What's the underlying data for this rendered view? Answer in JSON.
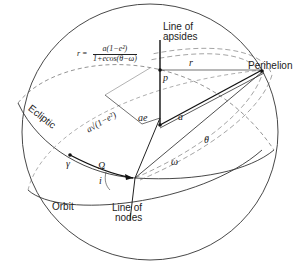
{
  "figure": {
    "labels": {
      "line_of_apsides": "Line of\napsides",
      "line_of_apsides_1": "Line of",
      "line_of_apsides_2": "apsides",
      "perihelion": "Perihelion",
      "ecliptic": "Ecliptic",
      "orbit": "Orbit",
      "line_of_nodes_1": "Line of",
      "line_of_nodes_2": "nodes"
    },
    "formula": {
      "lhs": "r =",
      "numerator": "a(1−e²)",
      "denominator": "1+ecos(θ−ω)"
    },
    "symbols": {
      "r": "r",
      "p": "p",
      "a": "a",
      "ae": "ae",
      "b": "a√(1−e²)",
      "vernal_equinox": "γ",
      "Omega": "Ω",
      "i": "i",
      "omega": "ω",
      "theta": "θ"
    },
    "colors": {
      "ink": "#222222",
      "dashed": "#555555",
      "background": "#ffffff"
    }
  }
}
